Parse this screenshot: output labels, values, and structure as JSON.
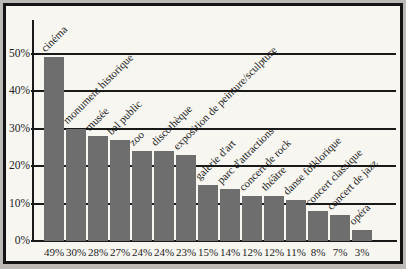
{
  "chart_data": {
    "type": "bar",
    "title": "",
    "xlabel": "",
    "ylabel": "",
    "categories": [
      "cinéma",
      "monument historique",
      "musée",
      "bal public",
      "zoo",
      "discothèque",
      "exposition de peinture/sculpture",
      "galerie d'art",
      "parc d'attractions",
      "concert de rock",
      "théâtre",
      "danse folklorique",
      "concert classique",
      "concert de jazz",
      "opéra"
    ],
    "values": [
      49,
      30,
      28,
      27,
      24,
      24,
      23,
      15,
      14,
      12,
      12,
      11,
      8,
      7,
      3
    ],
    "value_labels": [
      "49%",
      "30%",
      "28%",
      "27%",
      "24%",
      "24%",
      "23%",
      "15%",
      "14%",
      "12%",
      "12%",
      "11%",
      "8%",
      "7%",
      "3%"
    ],
    "y_ticks": [
      {
        "value": 0,
        "label": "0%"
      },
      {
        "value": 10,
        "label": "10%"
      },
      {
        "value": 20,
        "label": "20%"
      },
      {
        "value": 30,
        "label": "30%"
      },
      {
        "value": 40,
        "label": "40%"
      },
      {
        "value": 50,
        "label": "50%"
      }
    ],
    "ylim": [
      0,
      55
    ],
    "grid": true,
    "legend": "none",
    "category_label_rotation_deg": 45,
    "colors": {
      "bar": "#6e6e6e",
      "plot_background": "#f7f6f1",
      "outer_background": "#bcb9b6",
      "frame_border": "#141414",
      "axis_and_grid": "#191919",
      "text": "#1c1c1c"
    }
  }
}
